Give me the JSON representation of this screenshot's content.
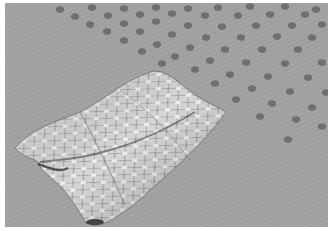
{
  "image": {
    "description": "Grayscale 3D rendering of a draped cloth-like mesh with a diamond lattice texture lying on a gray plane covered with a perspective grid of dark blob markings",
    "colors": {
      "border": "#ffffff",
      "ground": "#a3a3a3",
      "blob": "#6e6e6e",
      "cloth_light": "#ececec",
      "cloth_mid": "#bdbdbd",
      "cloth_dark": "#3a3a3a"
    },
    "elements": {
      "ground_plane": "gray ground plane",
      "blob_grid": "grid of dark spots in perspective",
      "cloth": "draped diamond-textured surface"
    }
  }
}
